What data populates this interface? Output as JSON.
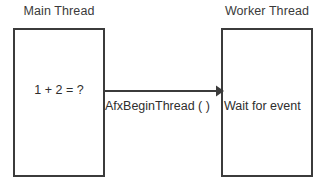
{
  "diagram": {
    "type": "sequence-diagram",
    "background_color": "#ffffff",
    "stroke_color": "#3b3b3b",
    "text_color": "#2e2e2e"
  },
  "columns": [
    {
      "id": "main-thread",
      "header": "Main Thread",
      "box_text": "1 + 2 = ?"
    },
    {
      "id": "worker-thread",
      "header": "Worker Thread",
      "box_text": "Wait for event"
    }
  ],
  "arrow": {
    "label": "AfxBeginThread ( )",
    "direction": "left-to-right",
    "from": "main-thread",
    "to": "worker-thread",
    "head": "solid-triangle"
  }
}
